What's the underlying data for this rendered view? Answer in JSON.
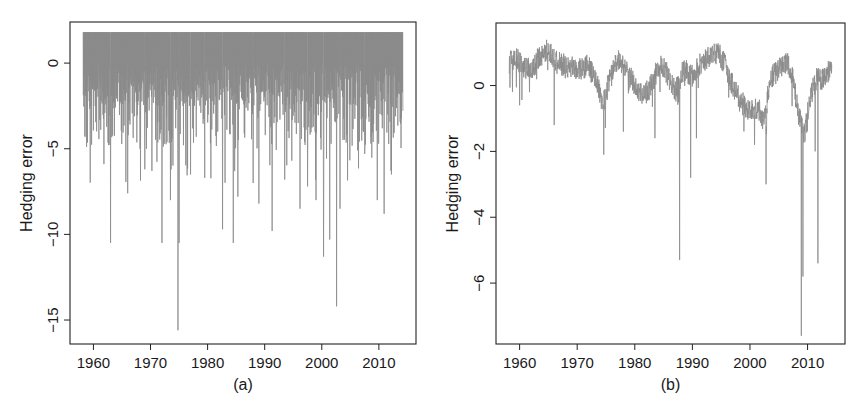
{
  "chart_data": [
    {
      "id": "a",
      "type": "line",
      "caption": "(a)",
      "title": "",
      "xlabel": "",
      "ylabel": "Hedging error",
      "xlim": [
        1955.9,
        2016.5
      ],
      "ylim": [
        -16.4,
        2.4
      ],
      "xticks": [
        1960,
        1970,
        1980,
        1990,
        2000,
        2010
      ],
      "xtick_labels": [
        "1960",
        "1970",
        "1980",
        "1990",
        "2000",
        "2010"
      ],
      "yticks": [
        0,
        -5,
        -10,
        -15
      ],
      "ytick_labels": [
        "0",
        "−5",
        "−10",
        "−15"
      ],
      "grid": false,
      "legend": null,
      "series_color": "#8a8a8a",
      "upper_cap": 1.8,
      "x_range": [
        1958.2,
        2014.2
      ],
      "notable_spikes": [
        {
          "x": 1958.8,
          "y": -4.9
        },
        {
          "x": 1963.0,
          "y": -10.5
        },
        {
          "x": 1966.0,
          "y": -7.6
        },
        {
          "x": 1969.0,
          "y": -6.2
        },
        {
          "x": 1972.0,
          "y": -10.5
        },
        {
          "x": 1973.5,
          "y": -8.0
        },
        {
          "x": 1974.8,
          "y": -15.6
        },
        {
          "x": 1975.0,
          "y": -10.5
        },
        {
          "x": 1977.0,
          "y": -6.5
        },
        {
          "x": 1979.5,
          "y": -6.7
        },
        {
          "x": 1982.6,
          "y": -9.7
        },
        {
          "x": 1984.5,
          "y": -10.5
        },
        {
          "x": 1985.3,
          "y": -7.8
        },
        {
          "x": 1988.0,
          "y": -7.0
        },
        {
          "x": 1989.0,
          "y": -8.2
        },
        {
          "x": 1991.3,
          "y": -9.8
        },
        {
          "x": 1993.5,
          "y": -6.8
        },
        {
          "x": 1996.2,
          "y": -8.5
        },
        {
          "x": 1997.5,
          "y": -7.2
        },
        {
          "x": 1999.0,
          "y": -8.0
        },
        {
          "x": 2000.3,
          "y": -11.3
        },
        {
          "x": 2001.4,
          "y": -10.3
        },
        {
          "x": 2002.6,
          "y": -14.2
        },
        {
          "x": 2003.2,
          "y": -8.5
        },
        {
          "x": 2007.5,
          "y": -5.3
        },
        {
          "x": 2009.7,
          "y": -8.0
        },
        {
          "x": 2010.9,
          "y": -8.8
        },
        {
          "x": 2012.2,
          "y": -6.5
        }
      ]
    },
    {
      "id": "b",
      "type": "line",
      "caption": "(b)",
      "title": "",
      "xlabel": "",
      "ylabel": "Hedging error",
      "xlim": [
        1955.9,
        2016.5
      ],
      "ylim": [
        -7.85,
        1.9
      ],
      "xticks": [
        1960,
        1970,
        1980,
        1990,
        2000,
        2010
      ],
      "xtick_labels": [
        "1960",
        "1970",
        "1980",
        "1990",
        "2000",
        "2010"
      ],
      "yticks": [
        0,
        -2,
        -4,
        -6
      ],
      "ytick_labels": [
        "0",
        "−2",
        "−4",
        "−6"
      ],
      "grid": false,
      "legend": null,
      "series_color": "#8a8a8a",
      "x_range": [
        1958.2,
        2014.2
      ],
      "baseline": [
        {
          "x": 1958.2,
          "y": 0.7
        },
        {
          "x": 1959.5,
          "y": 0.8
        },
        {
          "x": 1961.0,
          "y": 0.5
        },
        {
          "x": 1962.5,
          "y": 0.6
        },
        {
          "x": 1963.5,
          "y": 0.9
        },
        {
          "x": 1965.0,
          "y": 1.1
        },
        {
          "x": 1966.5,
          "y": 0.7
        },
        {
          "x": 1968.0,
          "y": 0.6
        },
        {
          "x": 1970.0,
          "y": 0.5
        },
        {
          "x": 1972.0,
          "y": 0.6
        },
        {
          "x": 1973.5,
          "y": 0.0
        },
        {
          "x": 1974.5,
          "y": -0.6
        },
        {
          "x": 1975.5,
          "y": 0.1
        },
        {
          "x": 1977.0,
          "y": 0.8
        },
        {
          "x": 1978.5,
          "y": 0.5
        },
        {
          "x": 1980.0,
          "y": 0.0
        },
        {
          "x": 1981.5,
          "y": -0.3
        },
        {
          "x": 1982.5,
          "y": -0.1
        },
        {
          "x": 1984.0,
          "y": 0.5
        },
        {
          "x": 1985.0,
          "y": 0.6
        },
        {
          "x": 1986.0,
          "y": 0.2
        },
        {
          "x": 1987.0,
          "y": -0.2
        },
        {
          "x": 1988.5,
          "y": 0.5
        },
        {
          "x": 1990.0,
          "y": 0.3
        },
        {
          "x": 1991.5,
          "y": 0.7
        },
        {
          "x": 1993.0,
          "y": 0.9
        },
        {
          "x": 1994.5,
          "y": 1.0
        },
        {
          "x": 1995.5,
          "y": 0.7
        },
        {
          "x": 1997.0,
          "y": 0.0
        },
        {
          "x": 1998.5,
          "y": -0.5
        },
        {
          "x": 2000.0,
          "y": -0.8
        },
        {
          "x": 2001.5,
          "y": -0.7
        },
        {
          "x": 2002.5,
          "y": -1.1
        },
        {
          "x": 2003.5,
          "y": 0.2
        },
        {
          "x": 2005.0,
          "y": 0.5
        },
        {
          "x": 2006.5,
          "y": 0.7
        },
        {
          "x": 2007.5,
          "y": 0.2
        },
        {
          "x": 2008.3,
          "y": -0.8
        },
        {
          "x": 2009.5,
          "y": -1.5
        },
        {
          "x": 2010.5,
          "y": -0.3
        },
        {
          "x": 2011.5,
          "y": 0.2
        },
        {
          "x": 2012.5,
          "y": 0.2
        },
        {
          "x": 2014.2,
          "y": 0.5
        }
      ],
      "notable_spikes": [
        {
          "x": 1960.0,
          "y": -0.6
        },
        {
          "x": 1966.0,
          "y": -1.2
        },
        {
          "x": 1974.6,
          "y": -2.1
        },
        {
          "x": 1978.0,
          "y": -1.4
        },
        {
          "x": 1983.5,
          "y": -1.6
        },
        {
          "x": 1987.8,
          "y": -5.3
        },
        {
          "x": 1989.7,
          "y": -2.8
        },
        {
          "x": 1990.7,
          "y": -1.6
        },
        {
          "x": 2000.8,
          "y": -1.8
        },
        {
          "x": 2002.8,
          "y": -3.0
        },
        {
          "x": 2008.9,
          "y": -7.6
        },
        {
          "x": 2009.2,
          "y": -5.8
        },
        {
          "x": 2011.8,
          "y": -5.4
        },
        {
          "x": 2011.3,
          "y": -2.0
        }
      ]
    }
  ],
  "layout": {
    "panels": [
      {
        "left": 70,
        "top": 22,
        "right": 416,
        "bottom": 344
      },
      {
        "left": 496,
        "top": 23,
        "right": 845,
        "bottom": 344
      }
    ]
  }
}
